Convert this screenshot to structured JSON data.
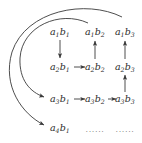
{
  "figure": {
    "background_color": "#ffffff",
    "text_color": "#2b2b2b",
    "arrow_color": "#3a3a3a",
    "ellipsis_color": "#6f6f6f",
    "width": 142,
    "height": 143
  },
  "nodes": [
    {
      "id": "n11",
      "a": "a",
      "a_sub": "1",
      "b": "b",
      "b_sub": "1",
      "label": "a1b1",
      "row": 1,
      "col": 1,
      "x": 60,
      "y": 32
    },
    {
      "id": "n12",
      "a": "a",
      "a_sub": "1",
      "b": "b",
      "b_sub": "2",
      "label": "a1b2",
      "row": 1,
      "col": 2,
      "x": 95,
      "y": 32
    },
    {
      "id": "n13",
      "a": "a",
      "a_sub": "1",
      "b": "b",
      "b_sub": "3",
      "label": "a1b3",
      "row": 1,
      "col": 3,
      "x": 125,
      "y": 32
    },
    {
      "id": "n21",
      "a": "a",
      "a_sub": "2",
      "b": "b",
      "b_sub": "1",
      "label": "a2b1",
      "row": 2,
      "col": 1,
      "x": 60,
      "y": 67
    },
    {
      "id": "n22",
      "a": "a",
      "a_sub": "2",
      "b": "b",
      "b_sub": "2",
      "label": "a2b2",
      "row": 2,
      "col": 2,
      "x": 95,
      "y": 67
    },
    {
      "id": "n23",
      "a": "a",
      "a_sub": "2",
      "b": "b",
      "b_sub": "3",
      "label": "a2b3",
      "row": 2,
      "col": 3,
      "x": 125,
      "y": 67
    },
    {
      "id": "n31",
      "a": "a",
      "a_sub": "3",
      "b": "b",
      "b_sub": "1",
      "label": "a3b1",
      "row": 3,
      "col": 1,
      "x": 60,
      "y": 99
    },
    {
      "id": "n32",
      "a": "a",
      "a_sub": "3",
      "b": "b",
      "b_sub": "2",
      "label": "a3b2",
      "row": 3,
      "col": 2,
      "x": 95,
      "y": 99
    },
    {
      "id": "n33",
      "a": "a",
      "a_sub": "3",
      "b": "b",
      "b_sub": "3",
      "label": "a3b3",
      "row": 3,
      "col": 3,
      "x": 125,
      "y": 99
    },
    {
      "id": "n41",
      "a": "a",
      "a_sub": "4",
      "b": "b",
      "b_sub": "1",
      "label": "a4b1",
      "row": 4,
      "col": 1,
      "x": 60,
      "y": 128
    }
  ],
  "ellipses": [
    {
      "id": "e42",
      "text": "......",
      "row": 4,
      "col": 2,
      "x": 95,
      "y": 129
    },
    {
      "id": "e43",
      "text": "......",
      "row": 4,
      "col": 3,
      "x": 125,
      "y": 129
    }
  ],
  "edges": [
    {
      "id": "d-11-21",
      "from": "n11",
      "to": "n21",
      "direction": "down",
      "kind": "straight"
    },
    {
      "id": "u-22-12",
      "from": "n22",
      "to": "n12",
      "direction": "up",
      "kind": "straight"
    },
    {
      "id": "u-23-13",
      "from": "n23",
      "to": "n13",
      "direction": "up",
      "kind": "straight"
    },
    {
      "id": "u-33-23",
      "from": "n33",
      "to": "n23",
      "direction": "up",
      "kind": "straight"
    },
    {
      "id": "r-21-22",
      "from": "n21",
      "to": "n22",
      "direction": "right",
      "kind": "straight"
    },
    {
      "id": "r-31-32",
      "from": "n31",
      "to": "n32",
      "direction": "right",
      "kind": "straight"
    },
    {
      "id": "r-32-33",
      "from": "n32",
      "to": "n33",
      "direction": "right",
      "kind": "straight"
    },
    {
      "id": "arc-12-31",
      "from": "n12",
      "to": "n31",
      "direction": "wrap",
      "kind": "arc",
      "note": "inner return arc"
    },
    {
      "id": "arc-13-41",
      "from": "n13",
      "to": "n41",
      "direction": "wrap",
      "kind": "arc",
      "note": "outer return arc"
    }
  ]
}
